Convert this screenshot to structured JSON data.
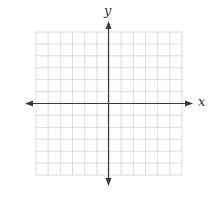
{
  "diagram": {
    "type": "coordinate-plane",
    "x_axis_label": "x",
    "y_axis_label": "y",
    "grid": {
      "columns": 12,
      "rows": 12,
      "left": 36,
      "top": 32,
      "right": 182,
      "bottom": 175,
      "line_color": "#d4d4d4"
    },
    "axes": {
      "origin_x": 108.5,
      "origin_y": 103.5,
      "color": "#3a3a3a",
      "x_start": 25,
      "x_end": 193,
      "y_start": 21,
      "y_end": 186
    }
  }
}
